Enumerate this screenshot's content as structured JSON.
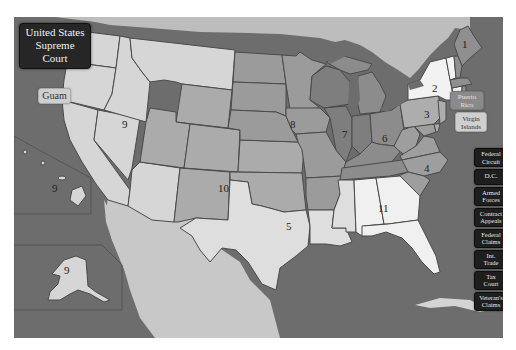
{
  "title": {
    "line1": "United States",
    "line2": "Supreme Court"
  },
  "territories": {
    "guam": "Guam",
    "puerto_rico": [
      "Puerto",
      "Rico"
    ],
    "virgin_islands": [
      "Virgin",
      "Islands"
    ]
  },
  "special_courts": [
    {
      "lines": [
        "Federal",
        "Circuit"
      ]
    },
    {
      "lines": [
        "D.C."
      ]
    },
    {
      "lines": [
        "Armed",
        "Forces"
      ]
    },
    {
      "lines": [
        "Contract",
        "Appeals"
      ]
    },
    {
      "lines": [
        "Federal",
        "Claims"
      ]
    },
    {
      "lines": [
        "Int.",
        "Trade"
      ]
    },
    {
      "lines": [
        "Tax",
        "Court"
      ]
    },
    {
      "lines": [
        "Veteran's",
        "Claims"
      ]
    }
  ],
  "circuit_labels": {
    "c1": "1",
    "c2": "2",
    "c3": "3",
    "c4": "4",
    "c5": "5",
    "c6": "6",
    "c7": "7",
    "c8": "8",
    "c9": "9",
    "c9_hawaii": "9",
    "c9_alaska": "9",
    "c10": "10",
    "c11": "11"
  },
  "colors": {
    "ocean": "#6d6d6d",
    "foreign_land": "#bdbdbd",
    "circuit_1": "#8f8f8f",
    "circuit_2": "#f2f2f2",
    "circuit_3": "#adadad",
    "circuit_4": "#9e9e9e",
    "circuit_5": "#dedede",
    "circuit_6": "#8c8c8c",
    "circuit_7": "#7e7e7e",
    "circuit_8": "#9b9b9b",
    "circuit_9": "#d6d6d6",
    "circuit_10": "#ababab",
    "circuit_11": "#f0f0f0",
    "title_bg": "#262626",
    "court_button_bg": "#1e1e1e"
  }
}
